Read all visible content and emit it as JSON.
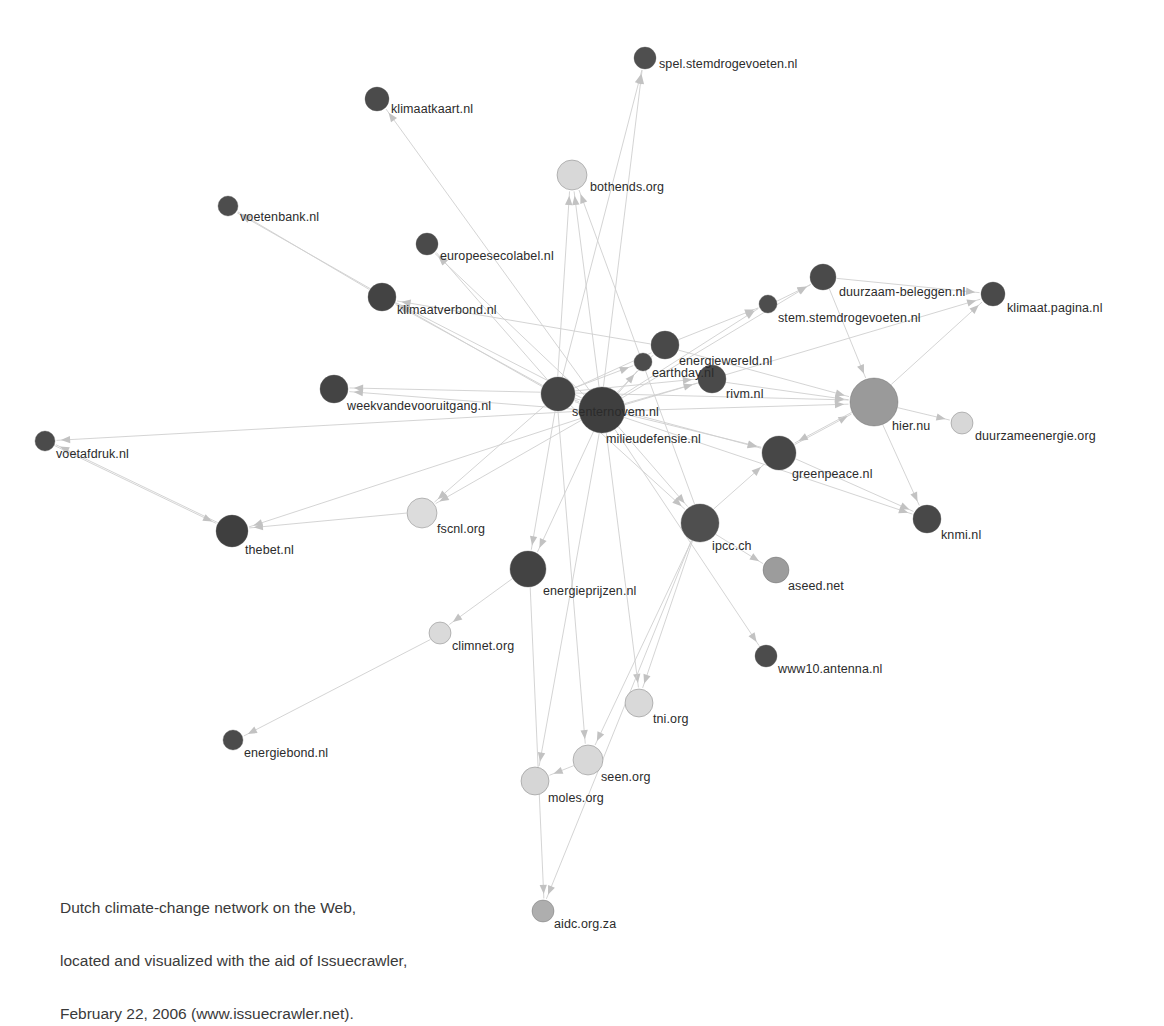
{
  "figure": {
    "title": "Dutch climate-change network on the Web",
    "caption_lines": [
      "Dutch climate-change network on the Web,",
      "located and visualized with the aid of Issuecrawler,",
      "February 22, 2006 (www.issuecrawler.net)."
    ],
    "background_color": "#ffffff",
    "edge_color": "#cfcfcf",
    "arrow_color": "#c2c2c2",
    "label_color": "#2b2b2b"
  },
  "chart_data": {
    "type": "network",
    "title": "Dutch climate-change network on the Web",
    "node_count": 31,
    "edge_count": 64,
    "directed": true,
    "size_meaning": "inlink count / centrality",
    "color_scale": [
      "#4a4a4a",
      "#6d6d6d",
      "#9a9a9a",
      "#c8c8c8",
      "#dcdcdc"
    ],
    "nodes": [
      {
        "id": "spel.stemdrogevoeten.nl",
        "label": "spel.stemdrogevoeten.nl",
        "x": 645,
        "y": 58,
        "r": 11,
        "color": "#4f4f4f",
        "label_dx": 14,
        "label_dy": 6
      },
      {
        "id": "klimaatkaart.nl",
        "label": "klimaatkaart.nl",
        "x": 377,
        "y": 99,
        "r": 12,
        "color": "#4b4b4b",
        "label_dx": 14,
        "label_dy": 10
      },
      {
        "id": "bothends.org",
        "label": "bothends.org",
        "x": 572,
        "y": 175,
        "r": 15,
        "color": "#d8d8d8",
        "label_dx": 18,
        "label_dy": 12
      },
      {
        "id": "voetenbank.nl",
        "label": "voetenbank.nl",
        "x": 228,
        "y": 206,
        "r": 10,
        "color": "#4d4d4d",
        "label_dx": 12,
        "label_dy": 11
      },
      {
        "id": "europeesecolabel.nl",
        "label": "europeesecolabel.nl",
        "x": 427,
        "y": 244,
        "r": 11,
        "color": "#4a4a4a",
        "label_dx": 13,
        "label_dy": 12
      },
      {
        "id": "klimaatverbond.nl",
        "label": "klimaatverbond.nl",
        "x": 382,
        "y": 297,
        "r": 14,
        "color": "#434343",
        "label_dx": 15,
        "label_dy": 13
      },
      {
        "id": "duurzaam-beleggen.nl",
        "label": "duurzaam-beleggen.nl",
        "x": 823,
        "y": 277,
        "r": 13,
        "color": "#4a4a4a",
        "label_dx": 16,
        "label_dy": 15
      },
      {
        "id": "stem.stemdrogevoeten.nl",
        "label": "stem.stemdrogevoeten.nl",
        "x": 768,
        "y": 304,
        "r": 9,
        "color": "#4d4d4d",
        "label_dx": 10,
        "label_dy": 14
      },
      {
        "id": "klimaat.pagina.nl",
        "label": "klimaat.pagina.nl",
        "x": 993,
        "y": 294,
        "r": 12,
        "color": "#4a4a4a",
        "label_dx": 14,
        "label_dy": 14
      },
      {
        "id": "energiewereld.nl",
        "label": "energiewereld.nl",
        "x": 665,
        "y": 345,
        "r": 14,
        "color": "#494949",
        "label_dx": 14,
        "label_dy": 16
      },
      {
        "id": "earthday.nl",
        "label": "earthday.nl",
        "x": 643,
        "y": 362,
        "r": 9,
        "color": "#4c4c4c",
        "label_dx": 9,
        "label_dy": 11
      },
      {
        "id": "rivm.nl",
        "label": "rivm.nl",
        "x": 712,
        "y": 379,
        "r": 14,
        "color": "#4a4a4a",
        "label_dx": 14,
        "label_dy": 15
      },
      {
        "id": "senternovem.nl",
        "label": "senternovem.nl",
        "x": 558,
        "y": 394,
        "r": 17,
        "color": "#454545",
        "label_dx": 14,
        "label_dy": 18
      },
      {
        "id": "milieudefensie.nl",
        "label": "milieudefensie.nl",
        "x": 602,
        "y": 410,
        "r": 23,
        "color": "#3f3f3f",
        "label_dx": 4,
        "label_dy": 29
      },
      {
        "id": "hier.nu",
        "label": "hier.nu",
        "x": 874,
        "y": 402,
        "r": 24,
        "color": "#9a9a9a",
        "label_dx": 18,
        "label_dy": 24
      },
      {
        "id": "duurzameenergie.org",
        "label": "duurzameenergie.org",
        "x": 962,
        "y": 423,
        "r": 11,
        "color": "#d7d7d7",
        "label_dx": 13,
        "label_dy": 13
      },
      {
        "id": "weekvandevooruitgang.nl",
        "label": "weekvandevooruitgang.nl",
        "x": 334,
        "y": 389,
        "r": 14,
        "color": "#444444",
        "label_dx": 13,
        "label_dy": 17
      },
      {
        "id": "voetafdruk.nl",
        "label": "voetafdruk.nl",
        "x": 45,
        "y": 441,
        "r": 10,
        "color": "#4b4b4b",
        "label_dx": 11,
        "label_dy": 13
      },
      {
        "id": "greenpeace.nl",
        "label": "greenpeace.nl",
        "x": 779,
        "y": 453,
        "r": 17,
        "color": "#474747",
        "label_dx": 13,
        "label_dy": 21
      },
      {
        "id": "knmi.nl",
        "label": "knmi.nl",
        "x": 927,
        "y": 519,
        "r": 14,
        "color": "#484848",
        "label_dx": 14,
        "label_dy": 16
      },
      {
        "id": "fscnl.org",
        "label": "fscnl.org",
        "x": 422,
        "y": 513,
        "r": 15,
        "color": "#dcdcdc",
        "label_dx": 15,
        "label_dy": 16
      },
      {
        "id": "thebet.nl",
        "label": "thebet.nl",
        "x": 232,
        "y": 531,
        "r": 16,
        "color": "#3f3f3f",
        "label_dx": 13,
        "label_dy": 19
      },
      {
        "id": "ipcc.ch",
        "label": "ipcc.ch",
        "x": 700,
        "y": 523,
        "r": 19,
        "color": "#4f4f4f",
        "label_dx": 12,
        "label_dy": 23
      },
      {
        "id": "aseed.net",
        "label": "aseed.net",
        "x": 776,
        "y": 570,
        "r": 13,
        "color": "#9c9c9c",
        "label_dx": 12,
        "label_dy": 16
      },
      {
        "id": "energieprijzen.nl",
        "label": "energieprijzen.nl",
        "x": 528,
        "y": 569,
        "r": 18,
        "color": "#434343",
        "label_dx": 15,
        "label_dy": 22
      },
      {
        "id": "climnet.org",
        "label": "climnet.org",
        "x": 440,
        "y": 633,
        "r": 11,
        "color": "#dadada",
        "label_dx": 12,
        "label_dy": 13
      },
      {
        "id": "www10.antenna.nl",
        "label": "www10.antenna.nl",
        "x": 766,
        "y": 656,
        "r": 11,
        "color": "#4c4c4c",
        "label_dx": 12,
        "label_dy": 13
      },
      {
        "id": "tni.org",
        "label": "tni.org",
        "x": 639,
        "y": 703,
        "r": 14,
        "color": "#d9d9d9",
        "label_dx": 14,
        "label_dy": 16
      },
      {
        "id": "seen.org",
        "label": "seen.org",
        "x": 588,
        "y": 760,
        "r": 15,
        "color": "#d8d8d8",
        "label_dx": 13,
        "label_dy": 17
      },
      {
        "id": "moles.org",
        "label": "moles.org",
        "x": 535,
        "y": 781,
        "r": 14,
        "color": "#d6d6d6",
        "label_dx": 13,
        "label_dy": 17
      },
      {
        "id": "aidc.org.za",
        "label": "aidc.org.za",
        "x": 543,
        "y": 911,
        "r": 11,
        "color": "#aeaeae",
        "label_dx": 11,
        "label_dy": 13
      }
    ],
    "edges": [
      {
        "from": "milieudefensie.nl",
        "to": "spel.stemdrogevoeten.nl"
      },
      {
        "from": "senternovem.nl",
        "to": "spel.stemdrogevoeten.nl"
      },
      {
        "from": "milieudefensie.nl",
        "to": "klimaatkaart.nl"
      },
      {
        "from": "senternovem.nl",
        "to": "bothends.org"
      },
      {
        "from": "milieudefensie.nl",
        "to": "bothends.org"
      },
      {
        "from": "ipcc.ch",
        "to": "bothends.org"
      },
      {
        "from": "senternovem.nl",
        "to": "voetenbank.nl"
      },
      {
        "from": "klimaatverbond.nl",
        "to": "voetenbank.nl"
      },
      {
        "from": "senternovem.nl",
        "to": "europeesecolabel.nl"
      },
      {
        "from": "milieudefensie.nl",
        "to": "europeesecolabel.nl"
      },
      {
        "from": "senternovem.nl",
        "to": "klimaatverbond.nl"
      },
      {
        "from": "milieudefensie.nl",
        "to": "klimaatverbond.nl"
      },
      {
        "from": "energiewereld.nl",
        "to": "klimaatverbond.nl"
      },
      {
        "from": "milieudefensie.nl",
        "to": "duurzaam-beleggen.nl"
      },
      {
        "from": "stem.stemdrogevoeten.nl",
        "to": "duurzaam-beleggen.nl"
      },
      {
        "from": "milieudefensie.nl",
        "to": "stem.stemdrogevoeten.nl"
      },
      {
        "from": "energiewereld.nl",
        "to": "stem.stemdrogevoeten.nl"
      },
      {
        "from": "milieudefensie.nl",
        "to": "klimaat.pagina.nl"
      },
      {
        "from": "hier.nu",
        "to": "klimaat.pagina.nl"
      },
      {
        "from": "duurzaam-beleggen.nl",
        "to": "klimaat.pagina.nl"
      },
      {
        "from": "senternovem.nl",
        "to": "energiewereld.nl"
      },
      {
        "from": "milieudefensie.nl",
        "to": "energiewereld.nl"
      },
      {
        "from": "senternovem.nl",
        "to": "earthday.nl"
      },
      {
        "from": "milieudefensie.nl",
        "to": "earthday.nl"
      },
      {
        "from": "senternovem.nl",
        "to": "rivm.nl"
      },
      {
        "from": "milieudefensie.nl",
        "to": "rivm.nl"
      },
      {
        "from": "rivm.nl",
        "to": "hier.nu"
      },
      {
        "from": "milieudefensie.nl",
        "to": "senternovem.nl"
      },
      {
        "from": "senternovem.nl",
        "to": "milieudefensie.nl"
      },
      {
        "from": "milieudefensie.nl",
        "to": "hier.nu"
      },
      {
        "from": "senternovem.nl",
        "to": "hier.nu"
      },
      {
        "from": "greenpeace.nl",
        "to": "hier.nu"
      },
      {
        "from": "energiewereld.nl",
        "to": "hier.nu"
      },
      {
        "from": "duurzaam-beleggen.nl",
        "to": "hier.nu"
      },
      {
        "from": "hier.nu",
        "to": "duurzameenergie.org"
      },
      {
        "from": "senternovem.nl",
        "to": "weekvandevooruitgang.nl"
      },
      {
        "from": "milieudefensie.nl",
        "to": "weekvandevooruitgang.nl"
      },
      {
        "from": "milieudefensie.nl",
        "to": "voetafdruk.nl"
      },
      {
        "from": "thebet.nl",
        "to": "voetafdruk.nl"
      },
      {
        "from": "milieudefensie.nl",
        "to": "greenpeace.nl"
      },
      {
        "from": "senternovem.nl",
        "to": "greenpeace.nl"
      },
      {
        "from": "hier.nu",
        "to": "greenpeace.nl"
      },
      {
        "from": "ipcc.ch",
        "to": "greenpeace.nl"
      },
      {
        "from": "milieudefensie.nl",
        "to": "knmi.nl"
      },
      {
        "from": "hier.nu",
        "to": "knmi.nl"
      },
      {
        "from": "greenpeace.nl",
        "to": "knmi.nl"
      },
      {
        "from": "senternovem.nl",
        "to": "fscnl.org"
      },
      {
        "from": "milieudefensie.nl",
        "to": "fscnl.org"
      },
      {
        "from": "milieudefensie.nl",
        "to": "thebet.nl"
      },
      {
        "from": "voetafdruk.nl",
        "to": "thebet.nl"
      },
      {
        "from": "fscnl.org",
        "to": "thebet.nl"
      },
      {
        "from": "milieudefensie.nl",
        "to": "ipcc.ch"
      },
      {
        "from": "senternovem.nl",
        "to": "ipcc.ch"
      },
      {
        "from": "ipcc.ch",
        "to": "aseed.net"
      },
      {
        "from": "milieudefensie.nl",
        "to": "energieprijzen.nl"
      },
      {
        "from": "senternovem.nl",
        "to": "energieprijzen.nl"
      },
      {
        "from": "energieprijzen.nl",
        "to": "climnet.org"
      },
      {
        "from": "climnet.org",
        "to": "energiebond.nl"
      },
      {
        "from": "milieudefensie.nl",
        "to": "www10.antenna.nl"
      },
      {
        "from": "ipcc.ch",
        "to": "tni.org"
      },
      {
        "from": "milieudefensie.nl",
        "to": "tni.org"
      },
      {
        "from": "ipcc.ch",
        "to": "seen.org"
      },
      {
        "from": "senternovem.nl",
        "to": "seen.org"
      },
      {
        "from": "milieudefensie.nl",
        "to": "moles.org"
      },
      {
        "from": "seen.org",
        "to": "moles.org"
      },
      {
        "from": "ipcc.ch",
        "to": "aidc.org.za"
      },
      {
        "from": "energieprijzen.nl",
        "to": "aidc.org.za"
      }
    ]
  },
  "extra_nodes": [
    {
      "id": "energiebond.nl",
      "label": "energiebond.nl",
      "x": 233,
      "y": 740,
      "r": 10,
      "color": "#4b4b4b",
      "label_dx": 11,
      "label_dy": 13
    }
  ]
}
